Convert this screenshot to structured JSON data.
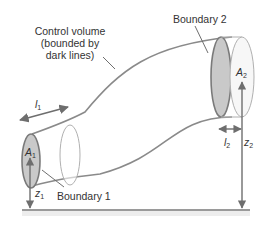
{
  "diagram": {
    "type": "control-volume pipe diagram",
    "labels": {
      "control_volume_line1": "Control volume",
      "control_volume_line2": "(bounded by",
      "control_volume_line3": "dark lines)",
      "boundary_1": "Boundary 1",
      "boundary_2": "Boundary 2"
    },
    "symbols": {
      "l1": {
        "base": "l",
        "sub": "1"
      },
      "l2": {
        "base": "l",
        "sub": "2"
      },
      "A1": {
        "base": "A",
        "sub": "1"
      },
      "A2": {
        "base": "A",
        "sub": "2"
      },
      "z1": {
        "base": "z",
        "sub": "1"
      },
      "z2": {
        "base": "z",
        "sub": "2"
      }
    },
    "colors": {
      "pipe_outline": "#8a8a8a",
      "boundary_fill": "#c9c9c9",
      "boundary_stroke": "#7a7a7a",
      "arrow": "#6e6e6e",
      "ground": "#9a9a9a",
      "text": "#333333"
    }
  }
}
